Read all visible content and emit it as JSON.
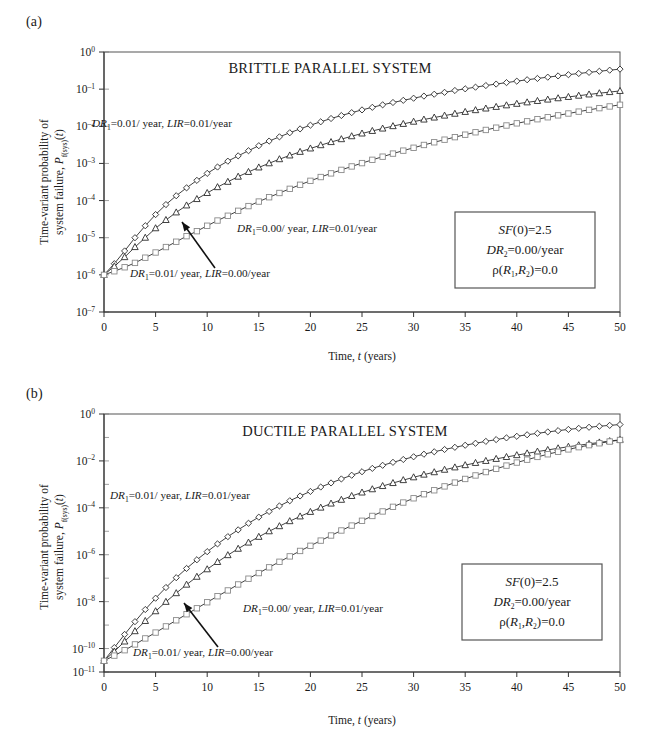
{
  "figure": {
    "panels": [
      {
        "letter": "(a)",
        "id": "panel-a"
      },
      {
        "letter": "(b)",
        "id": "panel-b"
      }
    ]
  },
  "axis_title_y": {
    "line1": "Time-variant probability of",
    "line2_pre": "system failure, ",
    "line2_sym": "P",
    "line2_sub": "f(sys)",
    "line2_post": "(",
    "line2_var": "t",
    "line2_end": ")"
  },
  "axis_title_x": {
    "pre": "Time, ",
    "var": "t",
    "post": " (years)"
  },
  "infobox": {
    "line1_sym": "SF",
    "line1_rest": "(0)=2.5",
    "line2_sym": "DR",
    "line2_sub": "2",
    "line2_rest": "=0.00/year",
    "line3_rho": "ρ(",
    "line3_r1": "R",
    "line3_sub1": "1",
    "line3_comma": ",",
    "line3_r2": "R",
    "line3_sub2": "2",
    "line3_rest": ")=0.0"
  },
  "curve_labels": {
    "top": {
      "sym": "DR",
      "sub": "1",
      "mid": "=0.01/ year, ",
      "sym2": "LIR",
      "rest": "=0.01/year"
    },
    "middle": {
      "sym": "DR",
      "sub": "1",
      "mid": "=0.00/ year, ",
      "sym2": "LIR",
      "rest": "=0.01/year"
    },
    "bottom": {
      "sym": "DR",
      "sub": "1",
      "mid": "=0.01/ year, ",
      "sym2": "LIR",
      "rest": "=0.00/year"
    }
  },
  "colors": {
    "axis": "#333333",
    "frame": "#555555",
    "curve": "#2b2b2b",
    "marker_fill": "#ffffff",
    "square_stroke": "#8a8a8a",
    "text": "#1a1a1a"
  },
  "chart_data": [
    {
      "type": "line",
      "panel": "(a)",
      "title": "BRITTLE PARALLEL SYSTEM",
      "xlabel": "Time, t (years)",
      "ylabel": "Time-variant probability of system failure, Pf(sys)(t)",
      "xlim": [
        0,
        50
      ],
      "ylim": [
        1e-07,
        1
      ],
      "yscale": "log",
      "xticks": [
        0,
        5,
        10,
        15,
        20,
        25,
        30,
        35,
        40,
        45,
        50
      ],
      "ytick_exponents": [
        0,
        -1,
        -2,
        -3,
        -4,
        -5,
        -6,
        -7
      ],
      "ytick_labels": [
        "10^0",
        "10^-1",
        "10^-2",
        "10^-3",
        "10^-4",
        "10^-5",
        "10^-6",
        "10^-7"
      ],
      "grid": false,
      "legend_position": "inline-annotations",
      "x": [
        0,
        1,
        2,
        3,
        4,
        5,
        6,
        7,
        8,
        9,
        10,
        11,
        12,
        13,
        14,
        15,
        16,
        17,
        18,
        19,
        20,
        21,
        22,
        23,
        24,
        25,
        26,
        27,
        28,
        29,
        30,
        31,
        32,
        33,
        34,
        35,
        36,
        37,
        38,
        39,
        40,
        41,
        42,
        43,
        44,
        45,
        46,
        47,
        48,
        49,
        50
      ],
      "series": [
        {
          "name": "DR1=0.01/year, LIR=0.01/year",
          "marker": "diamond",
          "values": [
            1e-06,
            2e-06,
            4.4e-06,
            1e-05,
            2.1e-05,
            4.2e-05,
            7.8e-05,
            0.000135,
            0.00022,
            0.00035,
            0.00054,
            0.0008,
            0.00115,
            0.0016,
            0.0022,
            0.003,
            0.004,
            0.0052,
            0.0067,
            0.0085,
            0.0107,
            0.0132,
            0.0162,
            0.0195,
            0.0233,
            0.0276,
            0.0324,
            0.0378,
            0.0437,
            0.05,
            0.057,
            0.065,
            0.073,
            0.082,
            0.092,
            0.102,
            0.113,
            0.125,
            0.137,
            0.15,
            0.164,
            0.179,
            0.194,
            0.21,
            0.227,
            0.245,
            0.264,
            0.283,
            0.303,
            0.324,
            0.346
          ]
        },
        {
          "name": "DR1=0.01/year, LIR=0.00/year",
          "marker": "triangle",
          "values": [
            1e-06,
            1.7e-06,
            3e-06,
            5.6e-06,
            1e-05,
            1.8e-05,
            3e-05,
            4.8e-05,
            7.4e-05,
            0.00011,
            0.00016,
            0.00023,
            0.00032,
            0.00044,
            0.00059,
            0.00078,
            0.00101,
            0.0013,
            0.00164,
            0.00205,
            0.00253,
            0.0031,
            0.00376,
            0.0045,
            0.0054,
            0.0064,
            0.0075,
            0.0087,
            0.0101,
            0.0116,
            0.0133,
            0.0152,
            0.0172,
            0.0194,
            0.0218,
            0.0244,
            0.0272,
            0.0301,
            0.0333,
            0.0367,
            0.0403,
            0.0441,
            0.0481,
            0.0524,
            0.0569,
            0.0617,
            0.0667,
            0.072,
            0.0776,
            0.0834,
            0.0895
          ]
        },
        {
          "name": "DR1=0.00/year, LIR=0.01/year",
          "marker": "square",
          "values": [
            1e-06,
            1.25e-06,
            1.6e-06,
            2.1e-06,
            2.9e-06,
            4e-06,
            5.6e-06,
            7.8e-06,
            1.1e-05,
            1.5e-05,
            2.1e-05,
            2.9e-05,
            3.9e-05,
            5.3e-05,
            7.1e-05,
            9.4e-05,
            0.000123,
            0.00016,
            0.000207,
            0.000266,
            0.00034,
            0.00043,
            0.00054,
            0.00067,
            0.00083,
            0.00102,
            0.00125,
            0.00152,
            0.00184,
            0.00221,
            0.00264,
            0.00314,
            0.00371,
            0.00436,
            0.0051,
            0.00594,
            0.0069,
            0.00797,
            0.00917,
            0.0105,
            0.012,
            0.0136,
            0.0155,
            0.0175,
            0.0197,
            0.0221,
            0.0248,
            0.0277,
            0.0308,
            0.0342,
            0.0379
          ]
        }
      ]
    },
    {
      "type": "line",
      "panel": "(b)",
      "title": "DUCTILE PARALLEL SYSTEM",
      "xlabel": "Time, t (years)",
      "ylabel": "Time-variant probability of system failure, Pf(sys)(t)",
      "xlim": [
        0,
        50
      ],
      "ylim": [
        1e-11,
        1
      ],
      "yscale": "log",
      "xticks": [
        0,
        5,
        10,
        15,
        20,
        25,
        30,
        35,
        40,
        45,
        50
      ],
      "ytick_exponents": [
        0,
        -2,
        -4,
        -6,
        -8,
        -10,
        -11
      ],
      "ytick_labels": [
        "10^0",
        "10^-2",
        "10^-4",
        "10^-6",
        "10^-8",
        "10^-10",
        "10^-11"
      ],
      "grid": false,
      "legend_position": "inline-annotations",
      "x": [
        0,
        1,
        2,
        3,
        4,
        5,
        6,
        7,
        8,
        9,
        10,
        11,
        12,
        13,
        14,
        15,
        16,
        17,
        18,
        19,
        20,
        21,
        22,
        23,
        24,
        25,
        26,
        27,
        28,
        29,
        30,
        31,
        32,
        33,
        34,
        35,
        36,
        37,
        38,
        39,
        40,
        41,
        42,
        43,
        44,
        45,
        46,
        47,
        48,
        49,
        50
      ],
      "series": [
        {
          "name": "DR1=0.01/year, LIR=0.01/year",
          "marker": "diamond",
          "values": [
            3e-11,
            1.1e-10,
            4e-10,
            1.4e-09,
            4.6e-09,
            1.4e-08,
            4e-08,
            1.05e-07,
            2.6e-07,
            6.1e-07,
            1.35e-06,
            2.9e-06,
            5.9e-06,
            1.15e-05,
            2.2e-05,
            4e-05,
            7e-05,
            0.00012,
            0.0002,
            0.00032,
            0.0005,
            0.00077,
            0.00115,
            0.0017,
            0.00245,
            0.00345,
            0.0048,
            0.0065,
            0.0087,
            0.0115,
            0.015,
            0.0193,
            0.0245,
            0.0307,
            0.038,
            0.0466,
            0.0565,
            0.068,
            0.081,
            0.096,
            0.112,
            0.13,
            0.15,
            0.172,
            0.195,
            0.22,
            0.245,
            0.272,
            0.3,
            0.328,
            0.355
          ]
        },
        {
          "name": "DR1=0.01/year, LIR=0.00/year",
          "marker": "triangle",
          "values": [
            3e-11,
            7.5e-11,
            2e-10,
            5.5e-10,
            1.5e-09,
            3.9e-09,
            9.8e-09,
            2.3e-08,
            5.3e-08,
            1.15e-07,
            2.4e-07,
            4.9e-07,
            9.6e-07,
            1.8e-06,
            3.3e-06,
            5.8e-06,
            1e-05,
            1.65e-05,
            2.7e-05,
            4.3e-05,
            6.7e-05,
            0.000102,
            0.000152,
            0.00022,
            0.00032,
            0.00045,
            0.00062,
            0.00085,
            0.00114,
            0.00152,
            0.002,
            0.0026,
            0.0033,
            0.0042,
            0.0053,
            0.0066,
            0.0082,
            0.01,
            0.0122,
            0.0147,
            0.0176,
            0.021,
            0.025,
            0.0294,
            0.0345,
            0.0402,
            0.0465,
            0.0535,
            0.0615,
            0.07,
            0.0795
          ]
        },
        {
          "name": "DR1=0.00/year, LIR=0.01/year",
          "marker": "square",
          "values": [
            3e-11,
            5e-11,
            8.5e-11,
            1.5e-10,
            2.7e-10,
            4.8e-10,
            8.8e-10,
            1.6e-09,
            2.9e-09,
            5.2e-09,
            9.4e-09,
            1.7e-08,
            3e-08,
            5.4e-08,
            9.5e-08,
            1.65e-07,
            2.9e-07,
            5e-07,
            8.5e-07,
            1.45e-06,
            2.4e-06,
            4e-06,
            6.6e-06,
            1.08e-05,
            1.75e-05,
            2.8e-05,
            4.5e-05,
            7e-05,
            0.00011,
            0.000168,
            0.000255,
            0.00038,
            0.00056,
            0.00082,
            0.00119,
            0.0017,
            0.0024,
            0.00335,
            0.0046,
            0.0063,
            0.0085,
            0.0113,
            0.0148,
            0.0192,
            0.0246,
            0.031,
            0.0385,
            0.047,
            0.0565,
            0.067,
            0.078
          ]
        }
      ]
    }
  ]
}
